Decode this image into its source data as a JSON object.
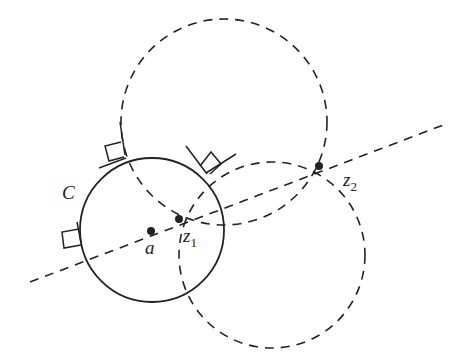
{
  "diagram": {
    "type": "geometry",
    "colors": {
      "stroke": "#222222",
      "background": "#ffffff"
    },
    "labels": {
      "circle": "C",
      "center": "a",
      "z1_main": "z",
      "z1_sub": "1",
      "z2_main": "z",
      "z2_sub": "2"
    },
    "circle_C": {
      "cx": 152,
      "cy": 230,
      "r": 72,
      "style": "solid"
    },
    "points": [
      {
        "name": "a",
        "x": 151,
        "y": 231
      },
      {
        "name": "z1",
        "x": 179,
        "y": 219
      },
      {
        "name": "z2",
        "x": 319,
        "y": 166
      }
    ],
    "line": {
      "x1": 30,
      "y1": 282,
      "x2": 446,
      "y2": 124,
      "style": "dashed"
    },
    "dashed_circles": [
      {
        "name": "upper-orthogonal-circle",
        "cx": 224,
        "cy": 122,
        "r": 103
      },
      {
        "name": "lower-orthogonal-circle",
        "cx": 272,
        "cy": 255,
        "r": 93
      }
    ]
  }
}
